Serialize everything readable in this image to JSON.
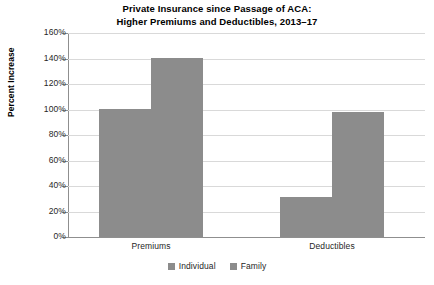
{
  "chart_data": {
    "type": "bar",
    "title": "Private Insurance since Passage of ACA: Higher Premiums and Deductibles, 2013–17",
    "title_line1": "Private Insurance since Passage of ACA:",
    "title_line2": "Higher Premiums and Deductibles, 2013–17",
    "xlabel": "",
    "ylabel": "Percent Increase",
    "categories": [
      "Premiums",
      "Deductibles"
    ],
    "series": [
      {
        "name": "Individual",
        "values": [
          100,
          31
        ],
        "color": "#8c8c8c"
      },
      {
        "name": "Family",
        "values": [
          140,
          98
        ],
        "color": "#8c8c8c"
      }
    ],
    "ylim": [
      0,
      160
    ],
    "ytick_step": 20,
    "ytick_labels": [
      "0%",
      "20%",
      "40%",
      "60%",
      "80%",
      "100%",
      "120%",
      "140%",
      "160%"
    ],
    "ytick_values": [
      0,
      20,
      40,
      60,
      80,
      100,
      120,
      140,
      160
    ],
    "grid": true,
    "legend_position": "bottom",
    "legend_entries": [
      "Individual",
      "Family"
    ],
    "background_color": "#ffffff",
    "gridline_color": "#d9d9d9",
    "axis_color": "#8f8f8f"
  }
}
